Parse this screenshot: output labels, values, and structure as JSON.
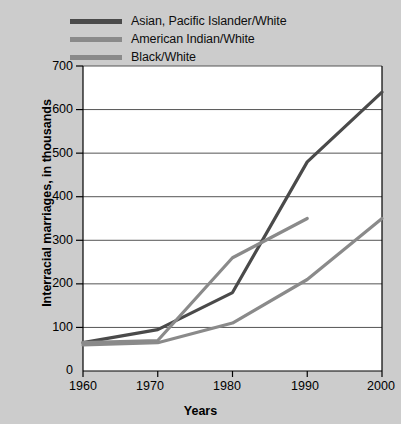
{
  "chart_data": {
    "type": "line",
    "title": "",
    "xlabel": "Years",
    "ylabel": "Interracial marriages, in thousands",
    "x": [
      1960,
      1970,
      1980,
      1990,
      2000
    ],
    "xticklabels": [
      "1960",
      "1970",
      "1980",
      "1990",
      "2000"
    ],
    "yticklabels": [
      "0",
      "100",
      "200",
      "300",
      "400",
      "500",
      "600",
      "700"
    ],
    "xlim": [
      1960,
      2000
    ],
    "ylim": [
      0,
      700
    ],
    "grid": "horizontal",
    "legend_position": "top-left-outside",
    "series": [
      {
        "name": "Asian, Pacific Islander/White",
        "color": "#4a4a4a",
        "x": [
          1960,
          1970,
          1980,
          1990,
          2000
        ],
        "values": [
          65,
          95,
          180,
          480,
          640
        ]
      },
      {
        "name": "American Indian/White",
        "color": "#8a8a8a",
        "x": [
          1960,
          1970,
          1980,
          1990
        ],
        "values": [
          65,
          70,
          260,
          350
        ]
      },
      {
        "name": "Black/White",
        "color": "#8a8a8a",
        "x": [
          1960,
          1970,
          1980,
          1990,
          2000
        ],
        "values": [
          60,
          65,
          110,
          210,
          350
        ]
      }
    ]
  },
  "legend": {
    "items": [
      {
        "label": "Asian, Pacific Islander/White",
        "color": "#4a4a4a"
      },
      {
        "label": "American Indian/White",
        "color": "#8a8a8a"
      },
      {
        "label": "Black/White",
        "color": "#8a8a8a"
      }
    ]
  },
  "axes": {
    "ylabel": "Interracial marriages, in thousands",
    "xlabel": "Years",
    "yticks": [
      "700",
      "600",
      "500",
      "400",
      "300",
      "200",
      "100",
      "0"
    ],
    "xticks": [
      "1960",
      "1970",
      "1980",
      "1990",
      "2000"
    ]
  },
  "colors": {
    "page_background": "#cccccc",
    "plot_background": "#ffffff",
    "gridline": "#555555",
    "axis": "#000000",
    "text": "#000000"
  }
}
